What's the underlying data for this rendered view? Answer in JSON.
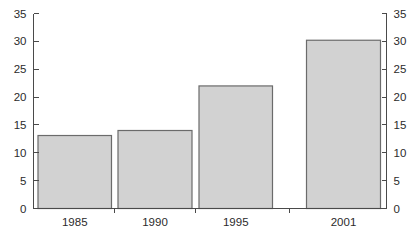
{
  "chart_data": {
    "type": "bar",
    "title": "",
    "subtitle": "",
    "xlabel": "",
    "ylabel": "",
    "ylabel_right": "",
    "categories": [
      "1985",
      "1990",
      "1995",
      "2001"
    ],
    "values": [
      13.1,
      14.0,
      22.0,
      30.2
    ],
    "series": [
      {
        "name": "",
        "values": [
          13.1,
          14.0,
          22.0,
          30.2
        ]
      }
    ],
    "ylim": [
      0,
      35
    ],
    "ylim_right": [
      0,
      35
    ],
    "y_ticks": [
      0,
      5,
      10,
      15,
      20,
      25,
      30,
      35
    ],
    "y_ticks_right": [
      0,
      5,
      10,
      15,
      20,
      25,
      30,
      35
    ],
    "y_tick_labels": [
      "0",
      "5",
      "10",
      "15",
      "20",
      "25",
      "30",
      "35"
    ],
    "y_tick_labels_right": [
      "0",
      "5",
      "10",
      "15",
      "20",
      "25",
      "30",
      "35"
    ],
    "grid": false,
    "legend": false,
    "legend_position": "none",
    "annotations": [],
    "dual_axis": true,
    "bar_fill_color": "#d2d2d2",
    "bar_border_color": "#6b6b6b",
    "axis_color": "#4a4a4a",
    "text_color": "#2b2b2b",
    "background_color": "#ffffff"
  }
}
